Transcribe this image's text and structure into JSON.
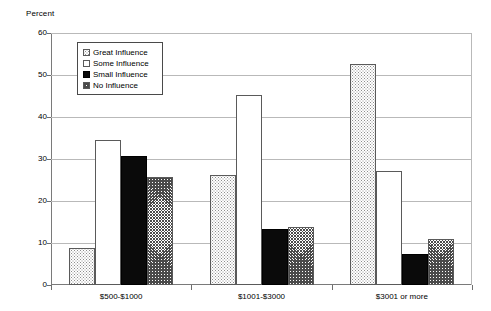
{
  "chart_data": {
    "type": "bar",
    "title": "",
    "subtitle": "",
    "xlabel": "",
    "ylabel": "Percent",
    "ylim": [
      0,
      60
    ],
    "yticks": [
      0,
      10,
      20,
      30,
      40,
      50,
      60
    ],
    "ytick_labels": [
      "0",
      "10",
      "20",
      "30",
      "40",
      "50",
      "60"
    ],
    "grid": true,
    "legend_position": "upper-left-inside",
    "categories": [
      "$500-$1000",
      "$1001-$3000",
      "$3001 or more"
    ],
    "series": [
      {
        "name": "Great Influence",
        "pattern": "light-dotted",
        "values": [
          8.7,
          26.1,
          52.6
        ]
      },
      {
        "name": "Some Influence",
        "pattern": "white-empty",
        "values": [
          34.5,
          45.2,
          27.1
        ]
      },
      {
        "name": "Small Influence",
        "pattern": "solid-black",
        "values": [
          30.6,
          13.4,
          7.5
        ]
      },
      {
        "name": "No Influence",
        "pattern": "crosshatch-gray",
        "values": [
          25.8,
          13.9,
          10.9
        ]
      }
    ]
  },
  "legend": {
    "items": [
      {
        "label": "Great Influence",
        "swatch": "legend-swatch-great-influence"
      },
      {
        "label": "Some Influence",
        "swatch": "legend-swatch-some-influence"
      },
      {
        "label": "Small Influence",
        "swatch": "legend-swatch-small-influence"
      },
      {
        "label": "No Influence",
        "swatch": "legend-swatch-no-influence"
      }
    ]
  },
  "colors": {
    "axis": "#7a7a7a",
    "gridline": "#b9b9b9",
    "bar_outline": "#5a5a5a",
    "solid_fill": "#0a0a0a",
    "background": "#ffffff"
  }
}
